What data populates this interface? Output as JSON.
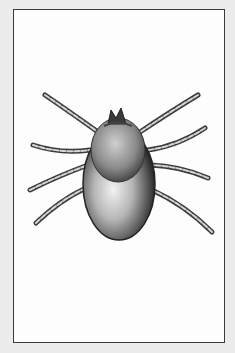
{
  "image": {
    "subject": "tick illustration",
    "style": "grayscale pencil drawing",
    "colors": {
      "background": "#ececec",
      "frame_fill": "#fdfdfd",
      "frame_border": "#3a3a3a",
      "body_dark": "#2a2a2a",
      "body_light": "#d8d8d8"
    },
    "legs": 8
  }
}
